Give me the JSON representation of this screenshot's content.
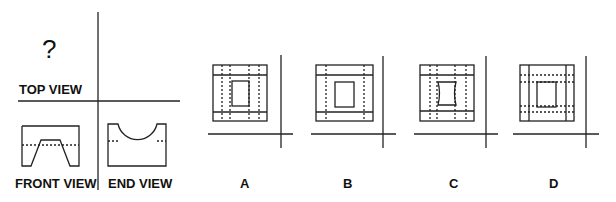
{
  "problem": {
    "unknown_marker": "?",
    "views": {
      "top_label": "TOP VIEW",
      "front_label": "FRONT VIEW",
      "end_label": "END VIEW"
    },
    "options": [
      {
        "label": "A"
      },
      {
        "label": "B"
      },
      {
        "label": "C"
      },
      {
        "label": "D"
      }
    ]
  },
  "colors": {
    "line": "#222222",
    "background": "#ffffff"
  }
}
